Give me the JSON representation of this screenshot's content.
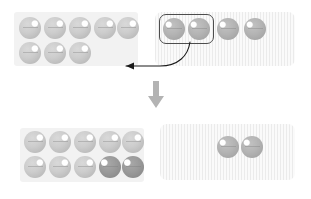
{
  "diagram": {
    "canvas": {
      "width": 311,
      "height": 199,
      "background": "#ffffff"
    },
    "colors": {
      "panel_plain_bg": "#f2f2f2",
      "panel_striped_bg": "#f4f4f4",
      "panel_stripe": "#ebebeb",
      "ball_light": "#cccccc",
      "ball_mid": "#b4b4b4",
      "ball_dark": "#9a9a9a",
      "selection_outline": "#4d4d4d",
      "arrow": "#1a1a1a",
      "step_arrow": "#b0b0b0"
    },
    "steps": [
      {
        "step_index": 1,
        "step_label": "before",
        "panels": [
          {
            "panel_name": "destination-panel",
            "style": "plain",
            "x": 14,
            "y": 12,
            "width": 124,
            "height": 54,
            "ball_count": 8,
            "rows": [
              {
                "row_index": 0,
                "balls": [
                  "light",
                  "light",
                  "light",
                  "light",
                  "light"
                ]
              },
              {
                "row_index": 1,
                "balls": [
                  "light",
                  "light",
                  "light"
                ]
              }
            ]
          },
          {
            "panel_name": "source-panel",
            "style": "striped",
            "x": 155,
            "y": 12,
            "width": 140,
            "height": 54,
            "ball_count": 4,
            "rows": [
              {
                "row_index": 0,
                "balls": [
                  "mid",
                  "mid",
                  "mid",
                  "mid"
                ]
              }
            ],
            "selection": {
              "selected_count": 2,
              "selected_indices": [
                0,
                1
              ],
              "x": 159,
              "y": 15,
              "width": 54,
              "height": 28
            }
          }
        ],
        "transfer_arrow": {
          "name": "transfer-arrow",
          "from": "source-panel-selection",
          "to": "destination-panel",
          "direction": "right-to-left",
          "curved": true
        }
      },
      {
        "step_index": 2,
        "step_label": "after",
        "panels": [
          {
            "panel_name": "destination-panel",
            "style": "plain",
            "x": 20,
            "y": 128,
            "width": 124,
            "height": 54,
            "ball_count": 10,
            "rows": [
              {
                "row_index": 0,
                "balls": [
                  "light",
                  "light",
                  "light",
                  "light",
                  "light"
                ]
              },
              {
                "row_index": 1,
                "balls": [
                  "light",
                  "light",
                  "light",
                  "dark",
                  "dark"
                ]
              }
            ]
          },
          {
            "panel_name": "source-panel",
            "style": "striped",
            "x": 160,
            "y": 124,
            "width": 135,
            "height": 56,
            "ball_count": 2,
            "rows": [
              {
                "row_index": 0,
                "balls": [
                  "mid",
                  "mid"
                ]
              }
            ]
          }
        ]
      }
    ],
    "step_arrow": {
      "name": "step-down-arrow",
      "label": "next step",
      "direction": "down",
      "x": 148,
      "y": 82,
      "width": 16,
      "height": 26
    }
  }
}
